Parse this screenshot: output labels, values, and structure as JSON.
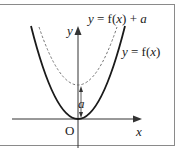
{
  "diagram": {
    "curves": [
      {
        "label": "y = f(x)",
        "style": "solid",
        "vertex": [
          0,
          0
        ]
      },
      {
        "label": "y = f(x) + a",
        "style": "dashed",
        "vertex": [
          0,
          "a"
        ]
      }
    ],
    "labels": {
      "shifted_curve": "y = f(x) + a",
      "shifted_curve_parts": {
        "y": "y",
        "eq": " = f(",
        "x": "x",
        "close": ") + ",
        "a": "a"
      },
      "base_curve": "y = f(x)",
      "base_curve_parts": {
        "y": "y",
        "eq": " = f(",
        "x": "x",
        "close": ")"
      },
      "y_axis": "y",
      "x_axis": "x",
      "origin": "O",
      "shift": "a"
    },
    "colors": {
      "curve": "#1a1a1a",
      "dashed": "#666666",
      "axis": "#333333",
      "frame": "#8a8a8a"
    }
  }
}
